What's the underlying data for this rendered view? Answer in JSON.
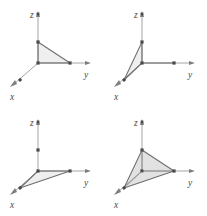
{
  "figure": {
    "axis_color": "#9a9a9a",
    "node_color": "#4a4a4a",
    "face_color": "#e9e9e9",
    "edge_color": "#8d8d8d",
    "background": "#ffffff"
  },
  "panels": [
    {
      "id": "panel-1",
      "name": "yz-face",
      "labels": {
        "x": "x",
        "y": "y",
        "z": "z"
      },
      "axes": {
        "z": {
          "origin": [
            38,
            63
          ],
          "tip": [
            38,
            13
          ],
          "label_pos": [
            30,
            15
          ]
        },
        "y": {
          "origin": [
            38,
            63
          ],
          "tip": [
            90,
            63
          ],
          "label_pos": [
            86,
            76
          ]
        },
        "x": {
          "origin": [
            38,
            63
          ],
          "tip": [
            10,
            87
          ],
          "label_pos": [
            10,
            99
          ]
        }
      },
      "nodes": [
        {
          "pos": [
            38,
            63
          ],
          "name": "origin"
        },
        {
          "pos": [
            38,
            42
          ],
          "name": "z-unit"
        },
        {
          "pos": [
            70,
            63
          ],
          "name": "y-unit"
        },
        {
          "pos": [
            20,
            80
          ],
          "name": "x-unit"
        },
        {
          "pos": [
            38,
            14
          ],
          "name": "z-axis-tip"
        }
      ],
      "polygon": [
        [
          38,
          42
        ],
        [
          70,
          63
        ],
        [
          38,
          63
        ]
      ],
      "polygon_name": "triangle-yz"
    },
    {
      "id": "panel-2",
      "name": "xz-face",
      "labels": {
        "x": "x",
        "y": "y",
        "z": "z"
      },
      "axes": {
        "z": {
          "origin": [
            38,
            63
          ],
          "tip": [
            38,
            13
          ],
          "label_pos": [
            30,
            15
          ]
        },
        "y": {
          "origin": [
            38,
            63
          ],
          "tip": [
            90,
            63
          ],
          "label_pos": [
            86,
            76
          ]
        },
        "x": {
          "origin": [
            38,
            63
          ],
          "tip": [
            10,
            87
          ],
          "label_pos": [
            10,
            99
          ]
        }
      },
      "nodes": [
        {
          "pos": [
            38,
            63
          ],
          "name": "origin"
        },
        {
          "pos": [
            38,
            42
          ],
          "name": "z-unit"
        },
        {
          "pos": [
            70,
            63
          ],
          "name": "y-unit"
        },
        {
          "pos": [
            20,
            80
          ],
          "name": "x-unit"
        },
        {
          "pos": [
            38,
            14
          ],
          "name": "z-axis-tip"
        }
      ],
      "polygon": [
        [
          38,
          42
        ],
        [
          38,
          63
        ],
        [
          20,
          80
        ]
      ],
      "polygon_name": "triangle-xz"
    },
    {
      "id": "panel-3",
      "name": "xy-face",
      "labels": {
        "x": "x",
        "y": "y",
        "z": "z"
      },
      "axes": {
        "z": {
          "origin": [
            38,
            63
          ],
          "tip": [
            38,
            13
          ],
          "label_pos": [
            30,
            15
          ]
        },
        "y": {
          "origin": [
            38,
            63
          ],
          "tip": [
            90,
            63
          ],
          "label_pos": [
            86,
            76
          ]
        },
        "x": {
          "origin": [
            38,
            63
          ],
          "tip": [
            10,
            87
          ],
          "label_pos": [
            10,
            99
          ]
        }
      },
      "nodes": [
        {
          "pos": [
            38,
            63
          ],
          "name": "origin"
        },
        {
          "pos": [
            38,
            42
          ],
          "name": "z-unit"
        },
        {
          "pos": [
            70,
            63
          ],
          "name": "y-unit"
        },
        {
          "pos": [
            20,
            80
          ],
          "name": "x-unit"
        },
        {
          "pos": [
            38,
            14
          ],
          "name": "z-axis-tip"
        }
      ],
      "polygon": [
        [
          38,
          63
        ],
        [
          70,
          63
        ],
        [
          20,
          80
        ]
      ],
      "polygon_name": "triangle-xy"
    },
    {
      "id": "panel-4",
      "name": "full-simplex",
      "labels": {
        "x": "x",
        "y": "y",
        "z": "z"
      },
      "axes": {
        "z": {
          "origin": [
            38,
            63
          ],
          "tip": [
            38,
            13
          ],
          "label_pos": [
            30,
            15
          ]
        },
        "y": {
          "origin": [
            38,
            63
          ],
          "tip": [
            90,
            63
          ],
          "label_pos": [
            86,
            76
          ]
        },
        "x": {
          "origin": [
            38,
            63
          ],
          "tip": [
            10,
            87
          ],
          "label_pos": [
            10,
            99
          ]
        }
      },
      "nodes": [
        {
          "pos": [
            38,
            63
          ],
          "name": "origin"
        },
        {
          "pos": [
            38,
            42
          ],
          "name": "z-unit"
        },
        {
          "pos": [
            70,
            63
          ],
          "name": "y-unit"
        },
        {
          "pos": [
            20,
            80
          ],
          "name": "x-unit"
        },
        {
          "pos": [
            38,
            14
          ],
          "name": "z-axis-tip"
        }
      ],
      "polygon": [
        [
          38,
          42
        ],
        [
          70,
          63
        ],
        [
          20,
          80
        ]
      ],
      "polygon_name": "triangle-outer",
      "extra_faces": [
        {
          "pts": [
            [
              38,
              42
            ],
            [
              38,
              63
            ],
            [
              70,
              63
            ]
          ],
          "name": "face-yz"
        },
        {
          "pts": [
            [
              38,
              42
            ],
            [
              38,
              63
            ],
            [
              20,
              80
            ]
          ],
          "name": "face-xz"
        },
        {
          "pts": [
            [
              38,
              63
            ],
            [
              70,
              63
            ],
            [
              20,
              80
            ]
          ],
          "name": "face-xy"
        }
      ]
    }
  ]
}
